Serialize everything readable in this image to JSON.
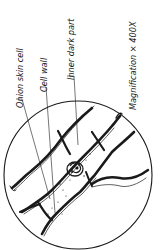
{
  "diagram": {
    "labels": {
      "onion_skin_cell": "Onion skin cell",
      "cell_wall": "Cell wall",
      "inner_dark_part": "Inner dark part",
      "magnification": "Magnification × 400X"
    },
    "colors": {
      "ink": "#1a1a1a",
      "background": "#ffffff"
    }
  }
}
